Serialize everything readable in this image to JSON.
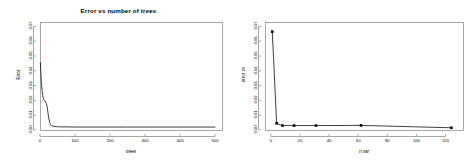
{
  "figure": {
    "background_color": "#ffffff",
    "axis_color": "#808080",
    "line_color": "#000000",
    "point_color": "#000000"
  },
  "chart_data": [
    {
      "id": "error-vs-trees",
      "type": "line",
      "title": "Error vs number of trees",
      "xlabel": "trees",
      "ylabel": "Error",
      "xlim": [
        0,
        520
      ],
      "ylim": [
        0,
        0.073
      ],
      "grid": false,
      "legend": "none",
      "xticks": [
        0,
        100,
        200,
        300,
        400,
        500
      ],
      "xticklabels": [
        "0",
        "100",
        "200",
        "300",
        "400",
        "500"
      ],
      "yticks": [
        0.0,
        0.01,
        0.02,
        0.03,
        0.04,
        0.05,
        0.06,
        0.07
      ],
      "yticklabels": [
        "0.00",
        "0.01",
        "0.02",
        "0.03",
        "0.04",
        "0.05",
        "0.06",
        "0.07"
      ],
      "x": [
        1,
        2,
        3,
        4,
        5,
        6,
        8,
        10,
        12,
        14,
        16,
        18,
        20,
        22,
        24,
        26,
        28,
        30,
        35,
        40,
        50,
        60,
        80,
        100,
        150,
        200,
        250,
        300,
        350,
        400,
        450,
        500
      ],
      "y": [
        0.0455,
        0.0415,
        0.036,
        0.032,
        0.029,
        0.0265,
        0.023,
        0.0208,
        0.02,
        0.0196,
        0.019,
        0.0178,
        0.016,
        0.013,
        0.0095,
        0.0068,
        0.0048,
        0.0036,
        0.0028,
        0.0024,
        0.0022,
        0.0021,
        0.0021,
        0.002,
        0.002,
        0.002,
        0.002,
        0.002,
        0.002,
        0.002,
        0.002,
        0.002
      ],
      "markers": false
    },
    {
      "id": "error-vs-nvar",
      "type": "line",
      "title": "",
      "xlabel": "n var",
      "ylabel": "error cv",
      "xlim": [
        -4,
        132
      ],
      "ylim": [
        0,
        0.073
      ],
      "grid": false,
      "legend": "none",
      "xticks": [
        0,
        20,
        40,
        60,
        80,
        100,
        120
      ],
      "xticklabels": [
        "0",
        "20",
        "40",
        "60",
        "80",
        "100",
        "120"
      ],
      "yticks": [
        0.0,
        0.01,
        0.02,
        0.03,
        0.04,
        0.05,
        0.06,
        0.07
      ],
      "yticklabels": [
        "0.00",
        "0.01",
        "0.02",
        "0.03",
        "0.04",
        "0.05",
        "0.06",
        "0.07"
      ],
      "x": [
        1,
        4,
        8,
        16,
        31,
        62,
        124
      ],
      "y": [
        0.0665,
        0.0045,
        0.003,
        0.003,
        0.003,
        0.0031,
        0.0015
      ],
      "markers": true
    }
  ]
}
